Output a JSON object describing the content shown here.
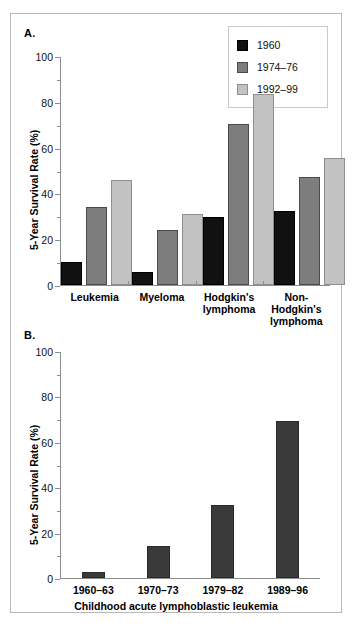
{
  "figure": {
    "background": "#ffffff",
    "border_color": "#b9b9b9"
  },
  "panel_a": {
    "letter": "A.",
    "ylabel": "5-Year Survival Rate (%)",
    "legend": {
      "items": [
        {
          "label": "1960",
          "color": "#111111"
        },
        {
          "label": "1974–76",
          "color": "#7d7d7d"
        },
        {
          "label": "1992–99",
          "color": "#c2c2c2"
        }
      ]
    },
    "y_ticks": [
      "0",
      "20",
      "40",
      "60",
      "80",
      "100"
    ],
    "categories": [
      {
        "line1": "Leukemia",
        "line2": "",
        "line3": ""
      },
      {
        "line1": "Myeloma",
        "line2": "",
        "line3": ""
      },
      {
        "line1": "Hodgkin's",
        "line2": "lymphoma",
        "line3": ""
      },
      {
        "line1": "Non-",
        "line2": "Hodgkin's",
        "line3": "lymphoma"
      }
    ]
  },
  "panel_b": {
    "letter": "B.",
    "ylabel": "5-Year Survival Rate (%)",
    "xlabel": "Childhood acute lymphoblastic leukemia",
    "y_ticks": [
      "0",
      "20",
      "40",
      "60",
      "80",
      "100"
    ],
    "bar_color": "#3a3a3a",
    "categories": [
      "1960–63",
      "1970–73",
      "1979–82",
      "1989–96"
    ]
  },
  "chart_data": [
    {
      "type": "bar",
      "panel": "A",
      "title": "",
      "xlabel": "",
      "ylabel": "5-Year Survival Rate (%)",
      "ylim": [
        0,
        100
      ],
      "yticks": [
        0,
        20,
        40,
        60,
        80,
        100
      ],
      "grid": false,
      "legend_position": "top-right",
      "categories": [
        "Leukemia",
        "Myeloma",
        "Hodgkin's lymphoma",
        "Non-Hodgkin's lymphoma"
      ],
      "series": [
        {
          "name": "1960",
          "color": "#111111",
          "values": [
            10,
            5.5,
            29.5,
            32.5
          ]
        },
        {
          "name": "1974–76",
          "color": "#7d7d7d",
          "values": [
            34,
            24,
            70.5,
            47
          ]
        },
        {
          "name": "1992–99",
          "color": "#c2c2c2",
          "values": [
            46,
            31,
            83.5,
            55.5
          ]
        }
      ]
    },
    {
      "type": "bar",
      "panel": "B",
      "title": "",
      "xlabel": "Childhood acute lymphoblastic leukemia",
      "ylabel": "5-Year Survival Rate (%)",
      "ylim": [
        0,
        100
      ],
      "yticks": [
        0,
        20,
        40,
        60,
        80,
        100
      ],
      "grid": false,
      "legend_position": "none",
      "categories": [
        "1960–63",
        "1970–73",
        "1979–82",
        "1989–96"
      ],
      "series": [
        {
          "name": "Childhood ALL",
          "color": "#3a3a3a",
          "values": [
            2.5,
            14,
            32,
            69
          ]
        }
      ]
    }
  ]
}
